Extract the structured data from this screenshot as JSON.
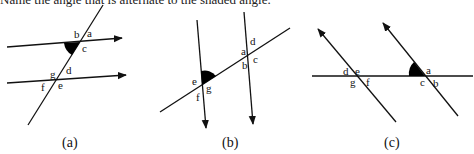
{
  "header": {
    "text": "Name the angle that is alternate to the shaded angle."
  },
  "diagrams": [
    {
      "caption": "(a)",
      "labels": {
        "a": "a",
        "b": "b",
        "c": "c",
        "d": "d",
        "e": "e",
        "f": "f",
        "g": "g"
      }
    },
    {
      "caption": "(b)",
      "labels": {
        "a": "a",
        "b": "b",
        "c": "c",
        "d": "d",
        "e": "e",
        "f": "f",
        "g": "g"
      }
    },
    {
      "caption": "(c)",
      "labels": {
        "a": "a",
        "b": "b",
        "c": "c",
        "d": "d",
        "e": "e",
        "f": "f",
        "g": "g"
      }
    }
  ],
  "colors": {
    "line": "#111111",
    "shade": "#000000"
  }
}
